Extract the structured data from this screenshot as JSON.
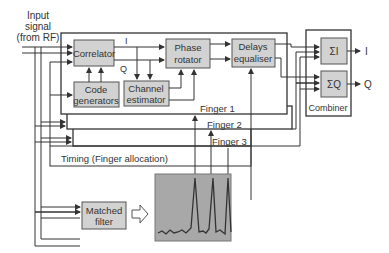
{
  "input": {
    "line1": "Input",
    "line2": "signal",
    "line3": "(from RF)"
  },
  "blocks": {
    "correlator": "Correlator",
    "code_generators": {
      "line1": "Code",
      "line2": "generators"
    },
    "phase_rotator": {
      "line1": "Phase",
      "line2": "rotator"
    },
    "channel_estimator": {
      "line1": "Channel",
      "line2": "estimator"
    },
    "delays_equaliser": {
      "line1": "Delays",
      "line2": "equaliser"
    },
    "sum_i": "ΣI",
    "sum_q": "ΣQ",
    "combiner": "Combiner",
    "matched_filter": {
      "line1": "Matched",
      "line2": "filter"
    }
  },
  "signals": {
    "i": "I",
    "q": "Q",
    "out_i": "I",
    "out_q": "Q"
  },
  "fingers": [
    "Finger 1",
    "Finger 2",
    "Finger 3"
  ],
  "timing": "Timing (Finger allocation)",
  "colors": {
    "block_fill": "#d2d2d2",
    "plot_bg": "#a8a8a8",
    "line": "#333333"
  }
}
